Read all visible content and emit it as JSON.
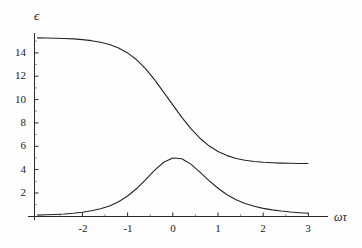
{
  "chart_data": {
    "type": "line",
    "title": "",
    "subtitle": "",
    "xlabel": "ωτ",
    "ylabel": "ϵ",
    "xlim": [
      -3,
      3
    ],
    "ylim": [
      0,
      15.6
    ],
    "grid": false,
    "legend": null,
    "xticks": [
      -2,
      -1,
      0,
      1,
      2,
      3
    ],
    "xticklabels": [
      "-2",
      "-1",
      "0",
      "1",
      "2",
      "3"
    ],
    "yticks": [
      2,
      4,
      6,
      8,
      10,
      12,
      14
    ],
    "yticklabels": [
      "2",
      "4",
      "6",
      "8",
      "10",
      "12",
      "14"
    ],
    "line_color": "#242424",
    "axis_color": "#2a2a2a",
    "background_color": "#fefefe",
    "series": [
      {
        "name": "real-part-dispersion",
        "description": "Debye real permittivity, high plateau 15.3 falling to 5.3",
        "x": [
          -3.0,
          -2.8,
          -2.6,
          -2.4,
          -2.2,
          -2.0,
          -1.8,
          -1.6,
          -1.4,
          -1.2,
          -1.0,
          -0.8,
          -0.6,
          -0.4,
          -0.2,
          0.0,
          0.2,
          0.4,
          0.6,
          0.8,
          1.0,
          1.2,
          1.4,
          1.6,
          1.8,
          2.0,
          2.2,
          2.4,
          2.6,
          2.8,
          3.0
        ],
        "values": [
          15.29,
          15.28,
          15.26,
          15.24,
          15.2,
          15.14,
          15.05,
          14.92,
          14.72,
          14.42,
          14.0,
          13.41,
          12.64,
          11.69,
          10.62,
          9.55,
          8.48,
          7.51,
          6.69,
          6.04,
          5.55,
          5.2,
          4.96,
          4.8,
          4.7,
          4.63,
          4.59,
          4.56,
          4.54,
          4.53,
          4.52
        ],
        "plateau_left": 15.3,
        "plateau_right": 5.3,
        "inflection_x": 0
      },
      {
        "name": "imaginary-part-absorption",
        "description": "Debye loss peak, maximum 5.0 at omega*tau = 0",
        "x": [
          -3.0,
          -2.8,
          -2.6,
          -2.4,
          -2.2,
          -2.0,
          -1.8,
          -1.6,
          -1.4,
          -1.2,
          -1.0,
          -0.8,
          -0.6,
          -0.4,
          -0.2,
          0.0,
          0.2,
          0.4,
          0.6,
          0.8,
          1.0,
          1.2,
          1.4,
          1.6,
          1.8,
          2.0,
          2.2,
          2.4,
          2.6,
          2.8,
          3.0
        ],
        "values": [
          0.1,
          0.13,
          0.16,
          0.2,
          0.26,
          0.35,
          0.47,
          0.64,
          0.89,
          1.25,
          1.74,
          2.38,
          3.15,
          3.95,
          4.63,
          5.0,
          4.93,
          4.47,
          3.79,
          3.06,
          2.4,
          1.85,
          1.42,
          1.1,
          0.86,
          0.68,
          0.55,
          0.45,
          0.37,
          0.31,
          0.26
        ],
        "peak_value": 5.0,
        "peak_x": 0
      }
    ]
  },
  "axes": {
    "y_axis_title": "ϵ",
    "x_axis_title": "ωτ"
  }
}
